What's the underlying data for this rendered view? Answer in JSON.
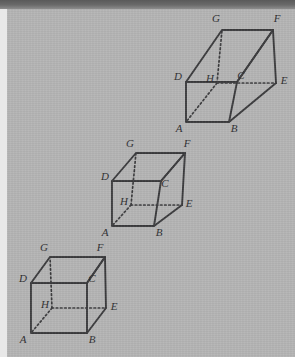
{
  "figure": {
    "background_color": "#b4b4b4",
    "ink_color": "#3a3a3c",
    "scan_band_color": "#6a6a6a",
    "margin_color": "#e8e8e8"
  },
  "cubes": [
    {
      "id": "cube-top",
      "position": "upper-right",
      "hidden_vertex": "H",
      "vertices": [
        {
          "label": "G",
          "x": 216,
          "y": 22,
          "role": "top-back-left"
        },
        {
          "label": "F",
          "x": 277,
          "y": 22,
          "role": "top-back-right"
        },
        {
          "label": "D",
          "x": 178,
          "y": 76,
          "role": "top-front-left"
        },
        {
          "label": "C",
          "x": 239,
          "y": 76,
          "role": "top-front-right"
        },
        {
          "label": "E",
          "x": 284,
          "y": 81,
          "role": "bottom-back-right"
        },
        {
          "label": "H",
          "x": 209,
          "y": 81,
          "role": "bottom-back-left"
        },
        {
          "label": "A",
          "x": 178,
          "y": 126,
          "role": "bottom-front-left"
        },
        {
          "label": "B",
          "x": 234,
          "y": 126,
          "role": "bottom-front-right"
        }
      ]
    },
    {
      "id": "cube-middle",
      "position": "centre",
      "hidden_vertex": "H",
      "vertices": [
        {
          "label": "G",
          "x": 130,
          "y": 146,
          "role": "top-back-left"
        },
        {
          "label": "F",
          "x": 186,
          "y": 146,
          "role": "top-back-right"
        },
        {
          "label": "D",
          "x": 104,
          "y": 177,
          "role": "top-front-left"
        },
        {
          "label": "C",
          "x": 163,
          "y": 182,
          "role": "top-front-right"
        },
        {
          "label": "E",
          "x": 188,
          "y": 203,
          "role": "bottom-back-right"
        },
        {
          "label": "H",
          "x": 122,
          "y": 203,
          "role": "bottom-back-left"
        },
        {
          "label": "A",
          "x": 104,
          "y": 233,
          "role": "bottom-front-left"
        },
        {
          "label": "B",
          "x": 159,
          "y": 233,
          "role": "bottom-front-right"
        }
      ]
    },
    {
      "id": "cube-bottom",
      "position": "lower-left",
      "hidden_vertex": "H",
      "vertices": [
        {
          "label": "G",
          "x": 44,
          "y": 250,
          "role": "top-back-left"
        },
        {
          "label": "F",
          "x": 99,
          "y": 250,
          "role": "top-back-right"
        },
        {
          "label": "D",
          "x": 22,
          "y": 279,
          "role": "top-front-left"
        },
        {
          "label": "C",
          "x": 90,
          "y": 279,
          "role": "top-front-right"
        },
        {
          "label": "E",
          "x": 114,
          "y": 306,
          "role": "bottom-back-right"
        },
        {
          "label": "H",
          "x": 45,
          "y": 306,
          "role": "bottom-back-left"
        },
        {
          "label": "A",
          "x": 22,
          "y": 339,
          "role": "bottom-front-left"
        },
        {
          "label": "B",
          "x": 92,
          "y": 339,
          "role": "bottom-front-right"
        }
      ]
    }
  ],
  "edges": {
    "visible": [
      "AB",
      "BC",
      "CD",
      "DA",
      "AE-front",
      "BF",
      "CF",
      "DG",
      "GF",
      "GD",
      "FE",
      "EB"
    ],
    "hidden": [
      "HG",
      "HE",
      "HA",
      "HC"
    ]
  }
}
